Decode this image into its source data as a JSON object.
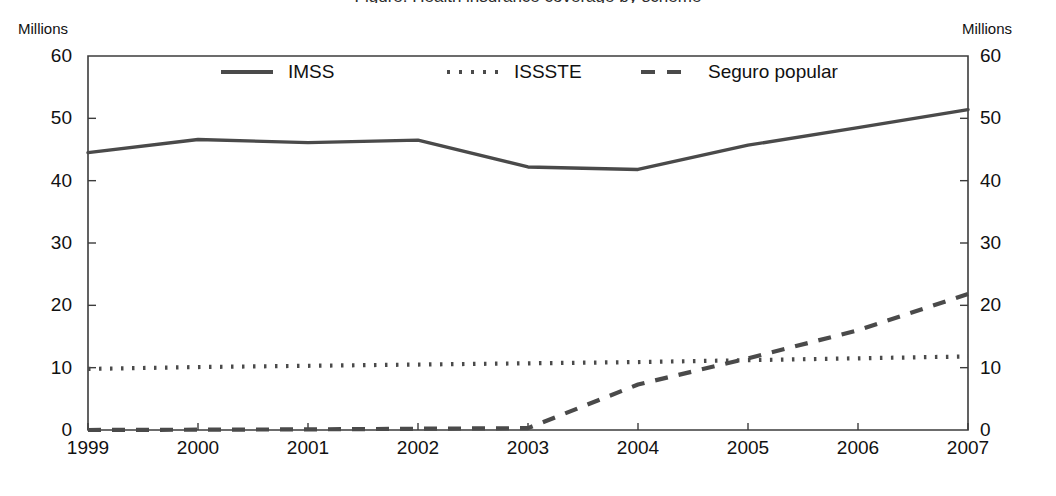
{
  "chart_data": {
    "type": "line",
    "title": "Figure: Health insurance coverage by scheme",
    "xlabel": "",
    "ylabel": "Millions",
    "y_left_label": "Millions",
    "y_right_label": "Millions",
    "categories": [
      "1999",
      "2000",
      "2001",
      "2002",
      "2003",
      "2004",
      "2005",
      "2006",
      "2007"
    ],
    "x": [
      1999,
      2000,
      2001,
      2002,
      2003,
      2004,
      2005,
      2006,
      2007
    ],
    "ylim": [
      0,
      60
    ],
    "yticks": [
      0,
      10,
      20,
      30,
      40,
      50,
      60
    ],
    "ytick_labels_left": [
      "0",
      "10",
      "20",
      "30",
      "40",
      "50",
      "60"
    ],
    "ytick_labels_right": [
      "0",
      "10",
      "20",
      "30",
      "40",
      "50",
      "60"
    ],
    "grid": false,
    "legend_position": "top-inside",
    "series": [
      {
        "name": "IMSS",
        "style": "solid",
        "color": "#4a4a4a",
        "values": [
          44.5,
          46.6,
          46.1,
          46.5,
          42.2,
          41.8,
          45.7,
          48.5,
          51.4
        ]
      },
      {
        "name": "ISSSTE",
        "style": "dotted",
        "color": "#4a4a4a",
        "values": [
          9.8,
          10.1,
          10.3,
          10.5,
          10.7,
          10.9,
          11.2,
          11.5,
          11.8
        ]
      },
      {
        "name": "Seguro popular",
        "style": "dashed",
        "color": "#4a4a4a",
        "values": [
          0.0,
          0.05,
          0.1,
          0.2,
          0.3,
          7.3,
          11.5,
          16.0,
          21.8
        ]
      }
    ]
  },
  "axes": {
    "unit_caption_left": "Millions",
    "unit_caption_right": "Millions"
  },
  "legend": {
    "entries": [
      {
        "label": "IMSS",
        "style": "solid"
      },
      {
        "label": "ISSSTE",
        "style": "dotted"
      },
      {
        "label": "Seguro popular",
        "style": "dashed"
      }
    ]
  },
  "colors": {
    "line": "#4a4a4a",
    "axis": "#3c3c3c",
    "text": "#111111",
    "background": "#ffffff"
  },
  "geometry": {
    "plot_left": 88,
    "plot_right": 968,
    "plot_top": 56,
    "plot_bottom": 430
  }
}
